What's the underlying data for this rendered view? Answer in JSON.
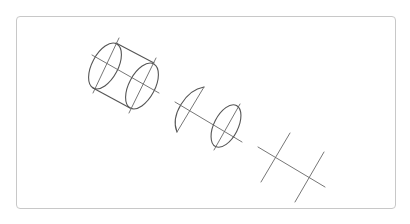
{
  "figure": {
    "colors": {
      "stroke": "#555555",
      "frame_border": "#c8c8c8",
      "background": "#ffffff"
    },
    "elements": [
      {
        "name": "cylinder",
        "label": ""
      },
      {
        "name": "half-ellipse-section",
        "label": ""
      },
      {
        "name": "ellipse-section",
        "label": ""
      },
      {
        "name": "cross-lines",
        "label": ""
      }
    ]
  }
}
